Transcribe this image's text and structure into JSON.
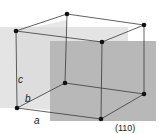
{
  "figure": {
    "labels": {
      "a": "a",
      "b": "b",
      "c": "c",
      "plane": "(110)"
    },
    "colors": {
      "edge": "#3a3a3a",
      "vertex": "#111111",
      "plane_dark": "#b4b4b4",
      "plane_light": "#dcdcdc",
      "background": "#ffffff"
    }
  }
}
